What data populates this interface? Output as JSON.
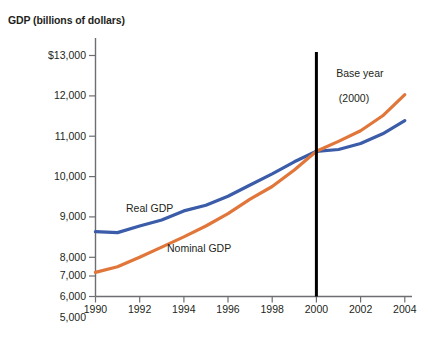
{
  "chart_data": {
    "type": "line",
    "title": "GDP (billions of dollars)",
    "xlabel": "",
    "ylabel": "GDP (billions of dollars)",
    "xlim": [
      1990,
      2004
    ],
    "ylim": [
      5000,
      13000
    ],
    "grid": false,
    "legend": "inline-labels",
    "x_ticks": [
      "1990",
      "1992",
      "1994",
      "1996",
      "1998",
      "2000",
      "2002",
      "2004"
    ],
    "x_tick_values": [
      1990,
      1992,
      1994,
      1996,
      1998,
      2000,
      2002,
      2004
    ],
    "y_ticks": [
      "5,000",
      "6,000",
      "7,000",
      "8,000",
      "9,000",
      "10,000",
      "11,000",
      "12,000",
      "$13,000"
    ],
    "y_tick_values": [
      5000,
      6000,
      7000,
      8000,
      9000,
      10000,
      11000,
      12000,
      13000
    ],
    "x": [
      1990,
      1991,
      1992,
      1993,
      1994,
      1995,
      1996,
      1997,
      1998,
      1999,
      2000,
      2001,
      2002,
      2003,
      2004
    ],
    "series": [
      {
        "name": "Real GDP",
        "color": "#3B5CA8",
        "values": [
          7150,
          7120,
          7340,
          7540,
          7840,
          8030,
          8330,
          8700,
          9070,
          9470,
          9820,
          9880,
          10080,
          10400,
          10840
        ]
      },
      {
        "name": "Nominal GDP",
        "color": "#E1763A",
        "values": [
          5800,
          5990,
          6300,
          6640,
          6980,
          7340,
          7750,
          8230,
          8650,
          9200,
          9820,
          10150,
          10500,
          11000,
          11700
        ]
      }
    ],
    "annotations": [
      {
        "name": "base-year-marker",
        "text_line1": "Base year",
        "text_line2": "(2000)",
        "x_value": 2000,
        "color": "#000000"
      }
    ]
  },
  "series_labels": {
    "real": "Real GDP",
    "nominal": "Nominal GDP"
  },
  "colors": {
    "real_gdp": "#3B5CA8",
    "nominal_gdp": "#E1763A",
    "axis": "#6d6e71",
    "base_year_line": "#000000",
    "text": "#231f20",
    "background": "#ffffff"
  }
}
